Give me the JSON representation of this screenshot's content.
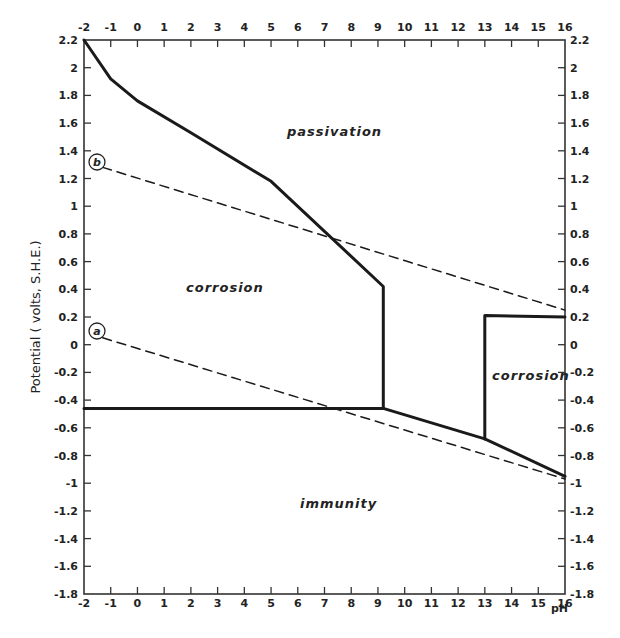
{
  "chart_data": {
    "type": "line",
    "title": "",
    "xlabel": "pH",
    "ylabel": "Potential (volts, S.H.E.)",
    "xlim": [
      -2,
      16
    ],
    "ylim": [
      -1.8,
      2.2
    ],
    "grid": false,
    "x_ticks": [
      -2,
      -1,
      0,
      1,
      2,
      3,
      4,
      5,
      6,
      7,
      8,
      9,
      10,
      11,
      12,
      13,
      14,
      15,
      16
    ],
    "x_tick_labels_top": [
      "-2",
      "-1",
      "0",
      "1",
      "2",
      "3",
      "4",
      "5",
      "6",
      "7",
      "8",
      "9",
      "10",
      "11",
      "12",
      "13",
      "14",
      "15",
      "16"
    ],
    "x_tick_labels_bottom": [
      "-2",
      "-1",
      "0",
      "1",
      "2",
      "3",
      "4",
      "5",
      "6",
      "7",
      "8",
      "9",
      "10",
      "11",
      "12",
      "13",
      "14",
      "15",
      "16"
    ],
    "y_ticks": [
      2.2,
      2,
      1.8,
      1.6,
      1.4,
      1.2,
      1,
      0.8,
      0.6,
      0.4,
      0.2,
      0,
      -0.2,
      -0.4,
      -0.6,
      -0.8,
      -1,
      -1.2,
      -1.4,
      -1.6,
      -1.8
    ],
    "y_tick_labels": [
      "2.2",
      "2",
      "1.8",
      "1.6",
      "1.4",
      "1.2",
      "1",
      "0.8",
      "0.6",
      "0.4",
      "0.2",
      "0",
      "-0.2",
      "-0.4",
      "-0.6",
      "-0.8",
      "-1",
      "-1.2",
      "-1.4",
      "-1.6",
      "-1.8"
    ],
    "series": [
      {
        "name": "passivation boundary",
        "style": "solid",
        "x": [
          -2,
          -1,
          0,
          2,
          5,
          9.2,
          9.2
        ],
        "y": [
          2.2,
          1.92,
          1.76,
          1.53,
          1.18,
          0.42,
          -0.46
        ]
      },
      {
        "name": "immunity boundary",
        "style": "solid",
        "x": [
          -2,
          9.2,
          13,
          16
        ],
        "y": [
          -0.46,
          -0.46,
          -0.68,
          -0.95
        ]
      },
      {
        "name": "alkaline corrosion boundary",
        "style": "solid",
        "x": [
          13,
          13,
          16
        ],
        "y": [
          -0.68,
          0.21,
          0.2
        ]
      },
      {
        "name": "b",
        "style": "dashed",
        "x": [
          -1.3,
          16
        ],
        "y": [
          1.28,
          0.25
        ]
      },
      {
        "name": "a",
        "style": "dashed",
        "x": [
          -1.3,
          16
        ],
        "y": [
          0.05,
          -0.97
        ]
      }
    ],
    "annotations": [
      {
        "text": "passivation",
        "x": 7.5,
        "y": 1.55
      },
      {
        "text": "corrosion",
        "x": 2.8,
        "y": 0.38
      },
      {
        "text": "corrosion",
        "x": 14.6,
        "y": -0.28
      },
      {
        "text": "immunity",
        "x": 8.2,
        "y": -1.07
      },
      {
        "text": "b",
        "x": -1.45,
        "y": 1.3,
        "circled": true
      },
      {
        "text": "a",
        "x": -1.45,
        "y": 0.07,
        "circled": true
      }
    ]
  },
  "labels": {
    "y_axis_title": "Potential ( volts, S.H.E.)",
    "x_axis_unit": "pH",
    "region_passivation": "passivation",
    "region_corrosion_left": "corrosion",
    "region_corrosion_right": "corrosion",
    "region_immunity": "immunity",
    "marker_a": "a",
    "marker_b": "b"
  },
  "colors": {
    "line": "#1a1a1a",
    "axis": "#333333",
    "background": "#ffffff"
  }
}
